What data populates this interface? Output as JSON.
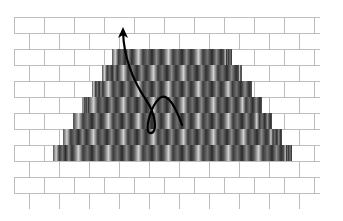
{
  "diagram": {
    "title": "",
    "canvas": {
      "width": 343,
      "height": 221
    },
    "grid": {
      "left": 14,
      "right": 320,
      "top": 17,
      "row_height": 16,
      "rows": 12,
      "brick_width": 30,
      "line_color": "#bdbdbd",
      "fill_color": "#ffffff"
    },
    "pyramid": {
      "rows": [
        {
          "row": 2,
          "x0": 112,
          "x1": 232
        },
        {
          "row": 3,
          "x0": 102,
          "x1": 242
        },
        {
          "row": 4,
          "x0": 92,
          "x1": 252
        },
        {
          "row": 5,
          "x0": 82,
          "x1": 262
        },
        {
          "row": 6,
          "x0": 73,
          "x1": 272
        },
        {
          "row": 7,
          "x0": 63,
          "x1": 282
        },
        {
          "row": 8,
          "x0": 53,
          "x1": 292
        }
      ],
      "colors": {
        "dark": "#2e2e2e",
        "mid": "#6a6a6a",
        "light": "#c8c8c8"
      }
    },
    "arrow": {
      "color": "#000000",
      "stroke_width": 2.2,
      "path": "M182,125 C176,108 168,92 160,98 C150,106 144,132 150,133 C158,134 156,114 146,100 C134,82 124,60 123,32",
      "head": {
        "x": 123,
        "y": 27
      }
    }
  }
}
